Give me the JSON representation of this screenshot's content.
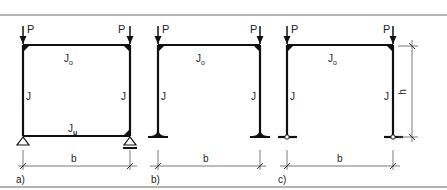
{
  "figure": {
    "colors": {
      "line": "#111111",
      "dim": "#555555",
      "border": "#999999"
    },
    "load_label": "P",
    "column_label": "J",
    "top_beam_label": "J",
    "top_beam_sub": "o",
    "span_label": "b",
    "height_label": "h"
  },
  "panels": [
    {
      "id": "a",
      "caption": "a)",
      "bottom_beam_label": "J",
      "bottom_beam_sub": "u",
      "support": "pinned-and-roller with closed bottom beam"
    },
    {
      "id": "b",
      "caption": "b)",
      "support": "fixed bases"
    },
    {
      "id": "c",
      "caption": "c)",
      "support": "hinged bases"
    }
  ]
}
